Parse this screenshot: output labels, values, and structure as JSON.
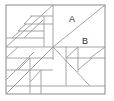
{
  "figure": {
    "name": "pieced-quilt-block-diagram",
    "type": "line-drawing",
    "background_color": "#ffffff",
    "line_color": "#9a9a9a",
    "frame_color": "#8a8a8a",
    "label_color": "#2a2a2a",
    "frame": {
      "x": 6,
      "y": 5,
      "width": 99,
      "height": 89
    },
    "labels": [
      {
        "id": "region-a",
        "text": "A",
        "x": 72,
        "y": 20
      },
      {
        "id": "region-b",
        "text": "B",
        "x": 85,
        "y": 42
      }
    ],
    "segments": [
      {
        "id": "mid-horizontal",
        "x1": 6,
        "y1": 47,
        "x2": 105,
        "y2": 47
      },
      {
        "id": "tr-diagonal",
        "x1": 53,
        "y1": 47,
        "x2": 105,
        "y2": 5
      },
      {
        "id": "tl-vertical",
        "x1": 53,
        "y1": 5,
        "x2": 53,
        "y2": 47
      },
      {
        "id": "tl-main-diag",
        "x1": 6,
        "y1": 47,
        "x2": 53,
        "y2": 5
      },
      {
        "id": "tl-inner-diag1",
        "x1": 6,
        "y1": 38,
        "x2": 44,
        "y2": 38
      },
      {
        "id": "tl-inner-diag2",
        "x1": 24,
        "y1": 38,
        "x2": 43,
        "y2": 20
      },
      {
        "id": "tl-rung-1",
        "x1": 30,
        "y1": 16,
        "x2": 53,
        "y2": 16
      },
      {
        "id": "tl-rung-2",
        "x1": 24,
        "y1": 24,
        "x2": 53,
        "y2": 24
      },
      {
        "id": "tl-rung-3",
        "x1": 18,
        "y1": 31,
        "x2": 44,
        "y2": 31
      },
      {
        "id": "tl-step-diag-a",
        "x1": 24,
        "y1": 24,
        "x2": 32,
        "y2": 16
      },
      {
        "id": "tl-step-diag-b",
        "x1": 18,
        "y1": 31,
        "x2": 26,
        "y2": 24
      },
      {
        "id": "tl-step-diag-c",
        "x1": 12,
        "y1": 38,
        "x2": 20,
        "y2": 31
      },
      {
        "id": "tl-riser",
        "x1": 44,
        "y1": 16,
        "x2": 44,
        "y2": 47
      },
      {
        "id": "bl-diag-main",
        "x1": 6,
        "y1": 94,
        "x2": 53,
        "y2": 47
      },
      {
        "id": "bl-band",
        "x1": 6,
        "y1": 58,
        "x2": 53,
        "y2": 58
      },
      {
        "id": "bl-diag-up",
        "x1": 6,
        "y1": 58,
        "x2": 18,
        "y2": 47
      },
      {
        "id": "bl-diag-2",
        "x1": 6,
        "y1": 80,
        "x2": 34,
        "y2": 52
      },
      {
        "id": "bl-band-2",
        "x1": 6,
        "y1": 70,
        "x2": 30,
        "y2": 70
      },
      {
        "id": "bl-diag-3",
        "x1": 18,
        "y1": 70,
        "x2": 30,
        "y2": 58
      },
      {
        "id": "bl-vert-1",
        "x1": 30,
        "y1": 58,
        "x2": 30,
        "y2": 94
      },
      {
        "id": "bl-vert-2",
        "x1": 41,
        "y1": 70,
        "x2": 41,
        "y2": 94
      },
      {
        "id": "bl-band-3",
        "x1": 30,
        "y1": 70,
        "x2": 53,
        "y2": 70
      },
      {
        "id": "bl-small-diag",
        "x1": 30,
        "y1": 82,
        "x2": 41,
        "y2": 70
      },
      {
        "id": "bl-base",
        "x1": 6,
        "y1": 86,
        "x2": 105,
        "y2": 86
      },
      {
        "id": "br-diag-main",
        "x1": 53,
        "y1": 47,
        "x2": 90,
        "y2": 86
      },
      {
        "id": "br-diag-b",
        "x1": 66,
        "y1": 47,
        "x2": 66,
        "y2": 86
      },
      {
        "id": "br-diag-c",
        "x1": 78,
        "y1": 47,
        "x2": 78,
        "y2": 72
      },
      {
        "id": "br-band",
        "x1": 66,
        "y1": 58,
        "x2": 105,
        "y2": 58
      },
      {
        "id": "br-diag-d",
        "x1": 66,
        "y1": 58,
        "x2": 78,
        "y2": 47
      },
      {
        "id": "br-diag-e",
        "x1": 78,
        "y1": 70,
        "x2": 92,
        "y2": 58
      },
      {
        "id": "br-diag-f",
        "x1": 90,
        "y1": 58,
        "x2": 105,
        "y2": 47
      },
      {
        "id": "br-right-diag",
        "x1": 53,
        "y1": 47,
        "x2": 53,
        "y2": 60
      }
    ]
  }
}
